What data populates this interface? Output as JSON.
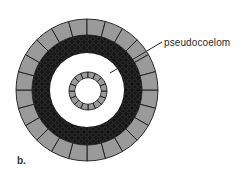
{
  "figure": {
    "panel_label": "b.",
    "callouts": [
      {
        "text": "pseudocoelom"
      }
    ]
  },
  "colors": {
    "ectoderm": "#9a9a9a",
    "mesoderm": "#151515",
    "mesoderm_cells": "#3a3a3a",
    "pseudocoelom": "#ffffff",
    "endoderm": "#9a9a9a",
    "outline": "#1a1a1a"
  },
  "geometry": {
    "center": [
      87,
      90
    ],
    "outer_ring": {
      "r_outer": 71,
      "r_inner": 55,
      "segments": 24
    },
    "mesoderm_ring": {
      "r_outer": 55,
      "r_inner": 37
    },
    "gut": {
      "center": [
        88,
        91
      ],
      "r_outer": 19,
      "r_inner": 13,
      "segments": 16
    },
    "leader_line": {
      "x1": 162,
      "y1": 42,
      "x2": 110,
      "y2": 73
    }
  }
}
